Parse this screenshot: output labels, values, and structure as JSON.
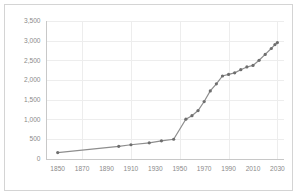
{
  "chart_data": {
    "type": "line",
    "title": "",
    "subtitle": "",
    "xlabel": "",
    "ylabel": "",
    "xlim": [
      1840,
      2035
    ],
    "ylim": [
      0,
      3500
    ],
    "grid": true,
    "legend": false,
    "legend_position": "none",
    "marker": "circle",
    "line_color": "#8e8e8e",
    "marker_color": "#6e6e6e",
    "grid_color": "#ededed",
    "axis_color": "#c8c8c8",
    "tick_label_color": "#8a8a8a",
    "background_color": "#ffffff",
    "border_color": "#d4d4d4",
    "ytick_labels": [
      "0",
      "500",
      "1,000",
      "1,500",
      "2,000",
      "2,500",
      "3,000",
      "3,500"
    ],
    "ytick_values": [
      0,
      500,
      1000,
      1500,
      2000,
      2500,
      3000,
      3500
    ],
    "xtick_labels": [
      "1850",
      "1870",
      "1890",
      "1910",
      "1930",
      "1950",
      "1970",
      "1990",
      "2010",
      "2030"
    ],
    "xtick_values": [
      1850,
      1870,
      1890,
      1910,
      1930,
      1950,
      1970,
      1990,
      2010,
      2030
    ],
    "x": [
      1850,
      1900,
      1910,
      1925,
      1935,
      1945,
      1955,
      1960,
      1965,
      1970,
      1975,
      1980,
      1985,
      1990,
      1995,
      2000,
      2005,
      2010,
      2015,
      2020,
      2025,
      2028,
      2030
    ],
    "values": [
      150,
      310,
      350,
      400,
      450,
      490,
      1000,
      1090,
      1220,
      1450,
      1720,
      1900,
      2100,
      2140,
      2180,
      2260,
      2330,
      2370,
      2500,
      2650,
      2800,
      2900,
      2950
    ],
    "series": [
      {
        "name": "series-1",
        "x": [
          1850,
          1900,
          1910,
          1925,
          1935,
          1945,
          1955,
          1960,
          1965,
          1970,
          1975,
          1980,
          1985,
          1990,
          1995,
          2000,
          2005,
          2010,
          2015,
          2020,
          2025,
          2028,
          2030
        ],
        "values": [
          150,
          310,
          350,
          400,
          450,
          490,
          1000,
          1090,
          1220,
          1450,
          1720,
          1900,
          2100,
          2140,
          2180,
          2260,
          2330,
          2370,
          2500,
          2650,
          2800,
          2900,
          2950
        ]
      }
    ]
  }
}
